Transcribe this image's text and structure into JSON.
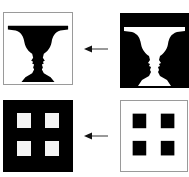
{
  "figure": {
    "rows": [
      {
        "left_panel": {
          "label": "Vase silhouette (black vase on white)",
          "background": "#ffffff",
          "foreground": "#000000"
        },
        "arrow": {
          "direction": "left"
        },
        "right_panel": {
          "label": "Faces-vase illusion (white vase on black)",
          "background": "#000000",
          "foreground": "#ffffff"
        }
      },
      {
        "left_panel": {
          "label": "Four white squares on black",
          "background": "#000000",
          "foreground": "#ffffff",
          "squares": 4
        },
        "arrow": {
          "direction": "left"
        },
        "right_panel": {
          "label": "Four black squares on white",
          "background": "#ffffff",
          "foreground": "#000000",
          "squares": 4
        }
      }
    ]
  },
  "colors": {
    "black": "#000000",
    "white": "#ffffff",
    "border": "#9a9a9a",
    "arrow": "#222222"
  }
}
